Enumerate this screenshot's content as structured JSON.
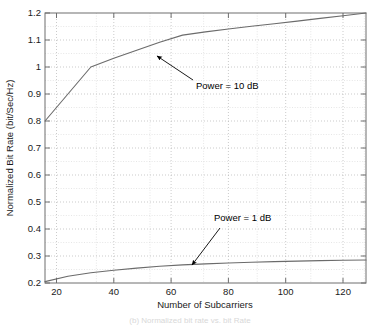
{
  "figure": {
    "background_color": "#ffffff",
    "axes_color": "#6e6e6e",
    "grid_color": "#bdbdbd",
    "curve_color": "#6b6b6b",
    "text_color": "#1a1a1a",
    "caption": "(b) Normalized bit rate vs. bit Rate",
    "caption_color": "#dcdcdc"
  },
  "chart_data": {
    "type": "line",
    "title": "",
    "xlabel": "Number of Subcarriers",
    "ylabel": "Normalized Bit Rate (bit/Sec/Hz)",
    "xlim": [
      16,
      128
    ],
    "ylim": [
      0.2,
      1.2
    ],
    "xticks": [
      20,
      40,
      60,
      80,
      100,
      120
    ],
    "xtick_labels": [
      "20",
      "40",
      "60",
      "80",
      "100",
      "120"
    ],
    "yticks": [
      0.2,
      0.3,
      0.4,
      0.5,
      0.6,
      0.7,
      0.8,
      0.9,
      1.0,
      1.1,
      1.2
    ],
    "ytick_labels": [
      "0.2",
      "0.3",
      "0.4",
      "0.5",
      "0.6",
      "0.7",
      "0.8",
      "0.9",
      "1",
      "1.1",
      "1.2"
    ],
    "grid": true,
    "grid_style": "dotted",
    "legend": "none",
    "series": [
      {
        "name": "Power = 10 dB",
        "x": [
          16,
          32,
          40,
          48,
          56,
          64,
          72,
          80,
          88,
          96,
          104,
          112,
          120,
          128
        ],
        "values": [
          0.8,
          1.0,
          1.032,
          1.062,
          1.092,
          1.118,
          1.13,
          1.141,
          1.151,
          1.16,
          1.17,
          1.18,
          1.19,
          1.2
        ]
      },
      {
        "name": "Power = 1 dB",
        "x": [
          16,
          24,
          32,
          40,
          48,
          56,
          64,
          72,
          80,
          88,
          96,
          104,
          112,
          120,
          128
        ],
        "values": [
          0.205,
          0.225,
          0.238,
          0.247,
          0.255,
          0.262,
          0.267,
          0.271,
          0.274,
          0.277,
          0.279,
          0.281,
          0.283,
          0.284,
          0.285
        ]
      }
    ],
    "annotations": [
      {
        "label": "Power = 10 dB",
        "text_x": 196,
        "text_y": 89,
        "arrow_from_x": 193,
        "arrow_from_y": 80,
        "arrow_to_x": 157,
        "arrow_to_y": 56
      },
      {
        "label": "Power = 1 dB",
        "text_x": 214,
        "text_y": 221,
        "arrow_from_x": 220,
        "arrow_from_y": 228,
        "arrow_to_x": 192,
        "arrow_to_y": 265
      }
    ]
  }
}
